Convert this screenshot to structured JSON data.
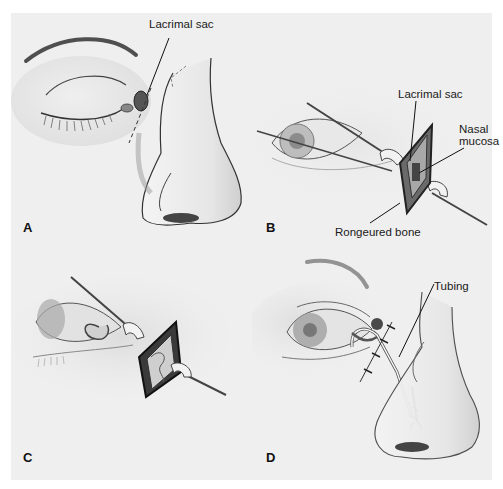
{
  "figure": {
    "colors": {
      "page_background": "#ffffff",
      "plate_background": "#efefef",
      "line_art": "#222222",
      "text": "#1a1a1a"
    },
    "panels": [
      {
        "letter": "A",
        "callouts": [
          {
            "label": "Lacrimal sac"
          }
        ]
      },
      {
        "letter": "B",
        "callouts": [
          {
            "label": "Lacrimal sac"
          },
          {
            "label_line1": "Nasal",
            "label_line2": "mucosa"
          },
          {
            "label": "Rongeured bone"
          }
        ]
      },
      {
        "letter": "C",
        "callouts": []
      },
      {
        "letter": "D",
        "callouts": [
          {
            "label": "Tubing"
          }
        ]
      }
    ]
  }
}
